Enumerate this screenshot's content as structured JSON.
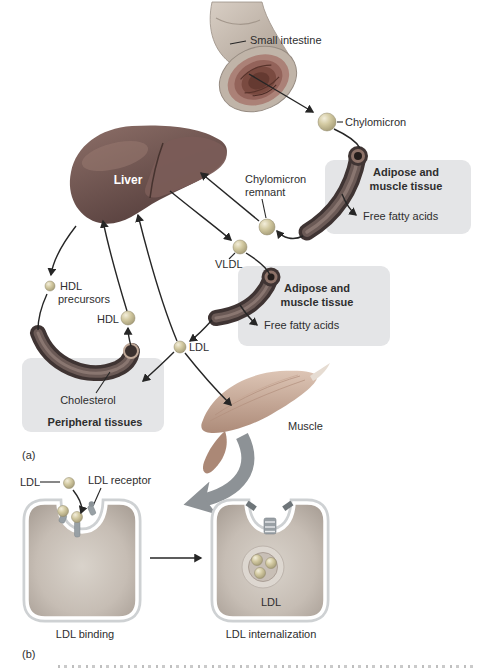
{
  "figure": {
    "panels": {
      "a": {
        "label": "(a)",
        "small_intestine": "Small intestine",
        "chylomicron": "Chylomicron",
        "liver": "Liver",
        "chylomicron_remnant": [
          "Chylomicron",
          "remnant"
        ],
        "adipose_box_top": [
          "Adipose and",
          "muscle tissue"
        ],
        "free_fatty_acids_top": "Free fatty acids",
        "vldl": "VLDL",
        "adipose_box_mid": [
          "Adipose and",
          "muscle tissue"
        ],
        "free_fatty_acids_mid": "Free fatty acids",
        "hdl_precursors": [
          "HDL",
          "precursors"
        ],
        "hdl": "HDL",
        "ldl": "LDL",
        "cholesterol": "Cholesterol",
        "peripheral_tissues": "Peripheral tissues",
        "muscle": "Muscle"
      },
      "b": {
        "label": "(b)",
        "ldl": "LDL",
        "ldl_receptor": "LDL receptor",
        "ldl_binding": "LDL binding",
        "ldl_vesicle": "LDL",
        "ldl_internalization": "LDL internalization"
      }
    },
    "colors": {
      "background": "#ffffff",
      "tissue_box": "#e4e5e7",
      "lipoprotein_sphere": "#cdc49c",
      "liver": "#6f5550",
      "vessel": "#4a3c3b",
      "muscle": "#c2a492",
      "big_arrow": "#8d9296",
      "arrow": "#262626",
      "text": "#2e2e2e",
      "cell_membrane": "#ced1d3",
      "cell_interior": "#c6bdb4"
    }
  }
}
